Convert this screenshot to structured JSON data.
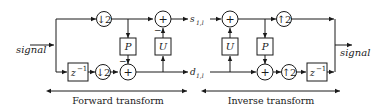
{
  "diagram": {
    "input_label": "signal",
    "output_label": "signal",
    "approx_label": "s",
    "approx_sub": "1,l",
    "detail_label": "d",
    "detail_sub": "1,l",
    "forward": {
      "downsample_top": "↓2",
      "downsample_bottom": "↓2",
      "delay": "z",
      "delay_exp": "−1",
      "predict": "P",
      "update": "U",
      "adder": "+",
      "minus": "−",
      "caption": "Forward transform"
    },
    "inverse": {
      "upsample_top": "↑2",
      "upsample_bottom": "↑2",
      "delay": "z",
      "delay_exp": "−1",
      "predict": "P",
      "update": "U",
      "adder": "+",
      "minus": "−",
      "caption": "Inverse transform"
    }
  }
}
